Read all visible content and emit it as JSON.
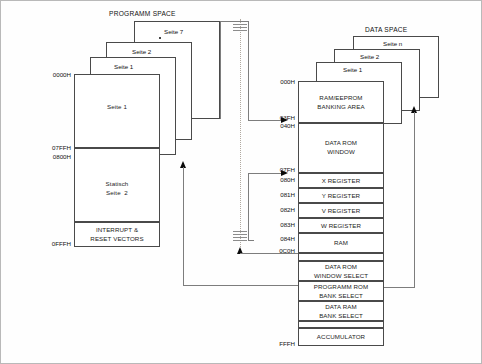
{
  "diagram": {
    "program_space": {
      "title": "PROGRAMM SPACE",
      "pages": [
        {
          "label": "Seite 7"
        },
        {
          "label": "Seite 2"
        },
        {
          "label": "Seite 1"
        }
      ],
      "front_page_label": "Seite 1",
      "static_block_line1": "Statisch",
      "static_block_line2": "Seite  2",
      "vectors_line1": "INTERRUPT &",
      "vectors_line2": "RESET VECTORS",
      "addresses": {
        "start": "0000H",
        "page_end": "07FFH",
        "static_start": "0800H",
        "end": "0FFFH"
      }
    },
    "data_space": {
      "title": "DATA SPACE",
      "pages": [
        {
          "label": "Seite n"
        },
        {
          "label": "Seite 2"
        },
        {
          "label": "Seite 1"
        }
      ],
      "blocks": [
        {
          "line1": "RAM/EEPROM",
          "line2": "BANKING AREA"
        },
        {
          "line1": "DATA ROM",
          "line2": "WINDOW"
        },
        {
          "line1": "X REGISTER",
          "line2": ""
        },
        {
          "line1": "Y REGISTER",
          "line2": ""
        },
        {
          "line1": "V REGISTER",
          "line2": ""
        },
        {
          "line1": "W REGISTER",
          "line2": ""
        },
        {
          "line1": "RAM",
          "line2": ""
        },
        {
          "line1": "DATA ROM",
          "line2": "WINDOW SELECT"
        },
        {
          "line1": "PROGRAMM ROM",
          "line2": "BANK SELECT"
        },
        {
          "line1": "DATA RAM",
          "line2": "BANK SELECT"
        },
        {
          "line1": "ACCUMULATOR",
          "line2": ""
        }
      ],
      "addresses": {
        "a000": "000H",
        "a03F": "03FH",
        "a040": "040H",
        "a07F": "07FH",
        "a080": "080H",
        "a081": "081H",
        "a082": "082H",
        "a083": "083H",
        "a084": "084H",
        "a0C0": "0C0H",
        "aFFF": "FFFH"
      }
    },
    "colors": {
      "line": "#4a4a4a",
      "arrow": "#0a0a0a",
      "bus": "#b0a9a0",
      "frame": "#b9b9b9"
    }
  }
}
